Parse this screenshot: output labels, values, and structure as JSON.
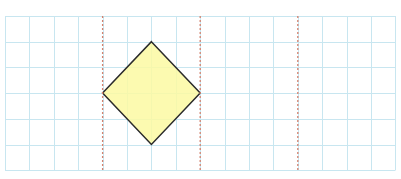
{
  "diagram": {
    "type": "grid-with-shape",
    "canvas": {
      "width": 401,
      "height": 179,
      "background": "#ffffff"
    },
    "grid": {
      "x0": 5,
      "y0": 16,
      "cols": 16,
      "rows": 6,
      "cell_w": 24.4,
      "cell_h": 25.7,
      "line_color": "#c8e6f0",
      "line_width": 1
    },
    "dashed_lines": {
      "color": "#d4826e",
      "width": 1.3,
      "dash": "2,2",
      "columns": [
        4,
        8,
        12
      ]
    },
    "shape": {
      "name": "square rotated 45° (diamond)",
      "fill": "#fbf9a2",
      "fill_opacity": 0.85,
      "stroke": "#2b2b2b",
      "stroke_width": 1.5,
      "vertices_grid": [
        {
          "label": "top",
          "col": 6,
          "row": 1
        },
        {
          "label": "right",
          "col": 8,
          "row": 3
        },
        {
          "label": "bottom",
          "col": 6,
          "row": 5
        },
        {
          "label": "left",
          "col": 4,
          "row": 3
        }
      ]
    }
  }
}
